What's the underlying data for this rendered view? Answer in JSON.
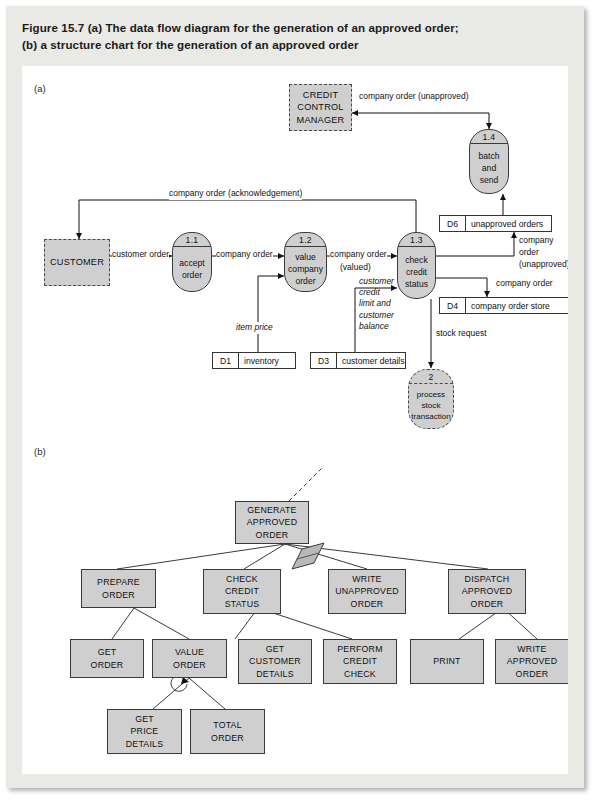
{
  "figure": {
    "caption_line1": "Figure 15.7 (a) The data flow diagram for the generation of an approved order;",
    "caption_line2": "(b) a structure chart for the generation of an approved order",
    "section_a_label": "(a)",
    "section_b_label": "(b)"
  },
  "dfd": {
    "external_entities": [
      {
        "name": "credit-control-manager",
        "line1": "CREDIT",
        "line2": "CONTROL",
        "line3": "MANAGER"
      },
      {
        "name": "customer",
        "line1": "CUSTOMER",
        "line2": "",
        "line3": ""
      }
    ],
    "processes": [
      {
        "id": "1.1",
        "line1": "accept",
        "line2": "order",
        "line3": ""
      },
      {
        "id": "1.2",
        "line1": "value",
        "line2": "company",
        "line3": "order"
      },
      {
        "id": "1.3",
        "line1": "check",
        "line2": "credit",
        "line3": "status"
      },
      {
        "id": "1.4",
        "line1": "batch",
        "line2": "and",
        "line3": "send"
      },
      {
        "id": "2",
        "line1": "process",
        "line2": "stock",
        "line3": "transaction"
      }
    ],
    "data_stores": [
      {
        "key": "D1",
        "name": "inventory"
      },
      {
        "key": "D3",
        "name": "customer details"
      },
      {
        "key": "D4",
        "name": "company order store"
      },
      {
        "key": "D6",
        "name": "unapproved orders"
      }
    ],
    "flows": {
      "company_order_unapproved_top": "company order (unapproved)",
      "company_order_acknowledgement": "company order (acknowledgement)",
      "customer_order": "customer order",
      "company_order_1": "company order",
      "company_order_2": "company order",
      "valued": "(valued)",
      "item_price": "item price",
      "customer_credit_l1": "customer",
      "customer_credit_l2": "credit",
      "customer_credit_l3": "limit and",
      "customer_credit_l4": "customer",
      "customer_credit_l5": "balance",
      "unapproved_l1": "company",
      "unapproved_l2": "order",
      "unapproved_l3": "(unapproved)",
      "company_order_to_d4": "company order",
      "stock_request": "stock request"
    }
  },
  "structure_chart": {
    "modules": [
      {
        "name": "generate-approved-order",
        "line1": "GENERATE",
        "line2": "APPROVED",
        "line3": "ORDER"
      },
      {
        "name": "prepare-order",
        "line1": "PREPARE",
        "line2": "ORDER",
        "line3": ""
      },
      {
        "name": "check-credit-status",
        "line1": "CHECK",
        "line2": "CREDIT",
        "line3": "STATUS"
      },
      {
        "name": "write-unapproved-order",
        "line1": "WRITE",
        "line2": "UNAPPROVED",
        "line3": "ORDER"
      },
      {
        "name": "dispatch-approved-order",
        "line1": "DISPATCH",
        "line2": "APPROVED",
        "line3": "ORDER"
      },
      {
        "name": "get-order",
        "line1": "GET",
        "line2": "ORDER",
        "line3": ""
      },
      {
        "name": "value-order",
        "line1": "VALUE",
        "line2": "ORDER",
        "line3": ""
      },
      {
        "name": "get-customer-details",
        "line1": "GET",
        "line2": "CUSTOMER",
        "line3": "DETAILS"
      },
      {
        "name": "perform-credit-check",
        "line1": "PERFORM",
        "line2": "CREDIT",
        "line3": "CHECK"
      },
      {
        "name": "print",
        "line1": "PRINT",
        "line2": "",
        "line3": ""
      },
      {
        "name": "write-approved-order",
        "line1": "WRITE",
        "line2": "APPROVED",
        "line3": "ORDER"
      },
      {
        "name": "get-price-details",
        "line1": "GET",
        "line2": "PRICE",
        "line3": "DETAILS"
      },
      {
        "name": "total-order",
        "line1": "TOTAL",
        "line2": "ORDER",
        "line3": ""
      }
    ]
  },
  "colors": {
    "panel_bg": "#e9e9e6",
    "node_fill": "#cfcfcf",
    "stroke": "#3a3a3a",
    "canvas": "#ffffff"
  }
}
